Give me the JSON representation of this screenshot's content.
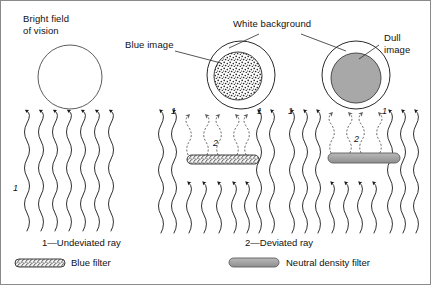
{
  "figure": {
    "title_labels": {
      "bright_field": "Bright field\nof vision",
      "blue_image": "Blue image",
      "white_background": "White background",
      "dull_image": "Dull\nimage"
    },
    "ray_numbers": {
      "undeviated": "1",
      "deviated": "2"
    },
    "captions": {
      "left": "1—Undeviated ray",
      "right": "2—Deviated ray"
    },
    "legend": [
      {
        "swatch": "blue-filter-swatch",
        "label": "Blue filter",
        "style": "stippled"
      },
      {
        "swatch": "neutral-density-filter-swatch",
        "label": "Neutral density filter",
        "style": "solid-gray"
      }
    ],
    "panels": [
      {
        "name": "bright-field-panel",
        "circle": {
          "fill": "white",
          "inner": null
        },
        "filter": null,
        "ray_count": 7,
        "deviated_rays": 0
      },
      {
        "name": "blue-filter-panel",
        "circle": {
          "fill": "white",
          "inner": "stippled"
        },
        "filter": "blue-filter",
        "ray_count": 9,
        "deviated_rays": 5
      },
      {
        "name": "neutral-density-filter-panel",
        "circle": {
          "fill": "white",
          "inner": "solid-gray"
        },
        "filter": "neutral-density-filter",
        "ray_count": 9,
        "deviated_rays": 5
      }
    ],
    "colors": {
      "stroke": "#1a1a1a",
      "gray_fill": "#a8a8a8",
      "gray_stroke": "#6b6b6b",
      "background": "#ffffff",
      "border": "#8a8a8a"
    }
  }
}
